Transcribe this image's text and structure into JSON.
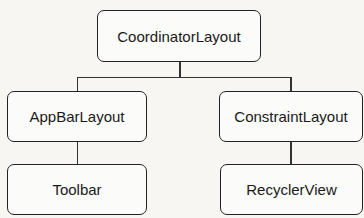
{
  "diagram": {
    "type": "hierarchy-tree",
    "root": {
      "label": "CoordinatorLayout"
    },
    "children": [
      {
        "label": "AppBarLayout",
        "children": [
          {
            "label": "Toolbar"
          }
        ]
      },
      {
        "label": "ConstraintLayout",
        "children": [
          {
            "label": "RecyclerView"
          }
        ]
      }
    ]
  }
}
